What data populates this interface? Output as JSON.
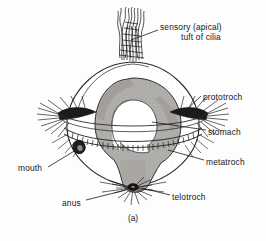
{
  "figure": {
    "caption": "(a)",
    "colors": {
      "background": "#fdfdfd",
      "ink": "#161616",
      "stomach_fill": "#b0aeab",
      "stomach_shade": "#9a9894",
      "body_outline": "#2a2a2a",
      "cilia": "#1a1a1a"
    }
  },
  "labels": {
    "sensory_line1": "sensory (apical)",
    "sensory_line2": "tuft of cilia",
    "prototroch": "prototroch",
    "stomach": "stomach",
    "metatroch": "metatroch",
    "telotroch": "telotroch",
    "mouth": "mouth",
    "anus": "anus"
  },
  "icons": {
    "apical_tuft": "cilia-tuft-icon",
    "prototroch_band": "ciliary-band-icon",
    "metatroch_band": "striped-ciliary-band-icon",
    "telotroch_band": "radiating-cilia-icon",
    "mouth_opening": "mouth-opening-icon",
    "anus_opening": "anus-opening-icon",
    "stomach_shape": "horseshoe-stomach-icon"
  }
}
